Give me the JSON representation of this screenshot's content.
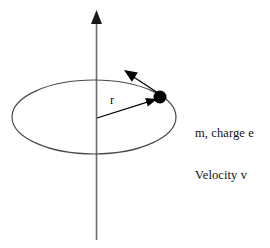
{
  "figure": {
    "background_color": "#ffffff"
  },
  "labels": {
    "radius": "r",
    "particle_line1": "m, charge e",
    "particle_line2": "Velocity v"
  },
  "elements": {
    "axis_name": "vertical-axis",
    "orbit_name": "orbit-ellipse",
    "particle_name": "particle-dot",
    "radius_vector_name": "radius-vector",
    "velocity_vector_name": "velocity-vector"
  },
  "geometry": {
    "axis": {
      "x": 96.5,
      "y_top": 12,
      "y_bottom": 240,
      "color": "#6b6b6b",
      "width": 1.6
    },
    "axis_arrow": {
      "tip_x": 96.5,
      "tip_y": 10,
      "half_width": 5.5,
      "height": 14,
      "color": "#1a1a1a"
    },
    "orbit": {
      "cx": 94,
      "cy": 117,
      "rx": 82,
      "ry": 37,
      "color": "#4a4a4a",
      "width": 1.2
    },
    "particle": {
      "cx": 160,
      "cy": 97,
      "r": 6.5,
      "color": "#000000"
    },
    "radius_vector": {
      "x1": 97,
      "y1": 118,
      "x2": 157,
      "y2": 99,
      "color": "#000000",
      "width": 1.3
    },
    "radius_arrow": {
      "tip_x": 157,
      "tip_y": 99,
      "angle_deg": -17.6,
      "half_width": 4.5,
      "height": 11,
      "color": "#000000"
    },
    "velocity_vector": {
      "x1": 158,
      "y1": 93,
      "x2": 126,
      "y2": 72,
      "color": "#000000",
      "width": 1.3
    },
    "velocity_arrow": {
      "tip_x": 124,
      "tip_y": 70,
      "angle_deg": 213,
      "half_width": 5.5,
      "height": 13,
      "color": "#000000"
    }
  },
  "colors": {
    "ink": "#000000",
    "axis_gray": "#6b6b6b",
    "orbit_gray": "#4a4a4a",
    "background": "#ffffff"
  }
}
